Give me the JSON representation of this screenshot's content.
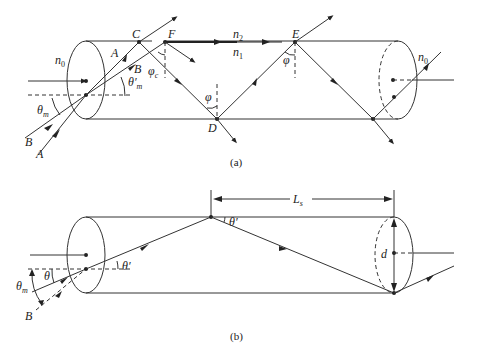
{
  "figure_a": {
    "caption": "(a)",
    "labels": {
      "n0_left": "n",
      "n0_left_sub": "0",
      "n0_right": "n",
      "n0_right_sub": "0",
      "n2": "n",
      "n2_sub": "2",
      "n1": "n",
      "n1_sub": "1",
      "C": "C",
      "F": "F",
      "E": "E",
      "D": "D",
      "A_inside": "A",
      "B_inside": "B",
      "B_outside": "B",
      "A_outside": "A",
      "phi_c": "φ",
      "phi_c_sub": "c",
      "phi_D": "φ",
      "phi_E": "φ",
      "theta_m": "θ",
      "theta_m_sub": "m",
      "theta_m_prime": "θ′",
      "theta_m_prime_sub": "m"
    }
  },
  "figure_b": {
    "caption": "(b)",
    "labels": {
      "Ls": "L",
      "Ls_sub": "s",
      "d": "d",
      "theta": "θ",
      "theta_prime_left": "θ′",
      "theta_prime_top": "θ′",
      "theta_m": "θ",
      "theta_m_sub": "m",
      "B": "B"
    }
  }
}
